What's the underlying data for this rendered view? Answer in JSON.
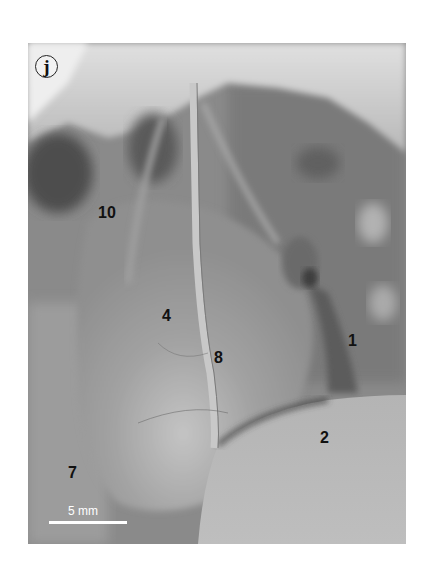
{
  "figure": {
    "panel_letter": "j",
    "labels": [
      {
        "id": "label-1",
        "text": "1",
        "x": 320,
        "y": 290
      },
      {
        "id": "label-2",
        "text": "2",
        "x": 292,
        "y": 387
      },
      {
        "id": "label-4",
        "text": "4",
        "x": 134,
        "y": 265
      },
      {
        "id": "label-7",
        "text": "7",
        "x": 40,
        "y": 422
      },
      {
        "id": "label-8",
        "text": "8",
        "x": 186,
        "y": 307
      },
      {
        "id": "label-10",
        "text": "10",
        "x": 70,
        "y": 162
      }
    ],
    "scale_bar": {
      "text": "5 mm",
      "length_px": 78
    },
    "colors": {
      "background": "#ffffff",
      "photo_mid_gray": "#8e8e8e",
      "label_text": "#111111",
      "scale_bar": "#ffffff"
    }
  }
}
